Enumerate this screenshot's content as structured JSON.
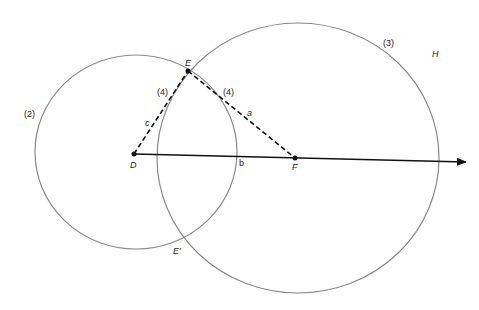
{
  "diagram": {
    "title": "",
    "colors": {
      "circle_stroke": "#8a8a8a",
      "line_stroke": "#111111",
      "background": "#ffffff"
    },
    "points": {
      "D": {
        "label": "D",
        "x": 134,
        "y": 154
      },
      "E": {
        "label": "E",
        "x": 188,
        "y": 71
      },
      "E_prime": {
        "label": "E′",
        "x": 185,
        "y": 238
      },
      "F": {
        "label": "F",
        "x": 295,
        "y": 158
      },
      "H": {
        "label": "H"
      }
    },
    "segments": {
      "a": {
        "label": "a",
        "from": "E",
        "to": "F",
        "style": "dashed"
      },
      "b": {
        "label": "b",
        "from": "D",
        "to": "F",
        "style": "solid"
      },
      "c": {
        "label": "c",
        "from": "D",
        "to": "E",
        "style": "dashed"
      }
    },
    "step_labels": {
      "circle_small": "(2)",
      "circle_large": "(3)",
      "arc_left": "(4)",
      "arc_right": "(4)"
    },
    "ray": {
      "from": "D",
      "direction": "right",
      "arrow": true
    }
  }
}
